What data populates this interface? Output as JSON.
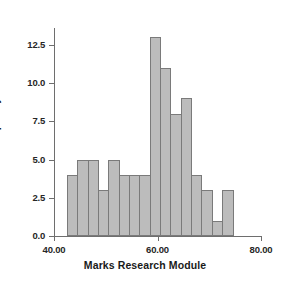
{
  "chart_data": {
    "type": "bar",
    "title": "",
    "xlabel": "Marks Research Module",
    "ylabel": "Frequency",
    "xlim": [
      40.0,
      80.0
    ],
    "ylim": [
      0.0,
      13.5
    ],
    "grid": false,
    "legend": null,
    "bin_width": 2.0,
    "bin_edges": [
      42.5,
      44.5,
      46.5,
      48.5,
      50.5,
      52.5,
      54.5,
      56.5,
      58.5,
      60.5,
      62.5,
      64.5,
      66.5,
      68.5,
      70.5,
      72.5,
      74.5
    ],
    "categories": [
      "42.5",
      "44.5",
      "46.5",
      "48.5",
      "50.5",
      "52.5",
      "54.5",
      "56.5",
      "58.5",
      "60.5",
      "62.5",
      "64.5",
      "66.5",
      "68.5",
      "70.5",
      "72.5"
    ],
    "values": [
      4,
      5,
      5,
      3,
      5,
      4,
      4,
      4,
      13,
      11,
      8,
      9,
      4,
      3,
      1,
      3
    ],
    "xticks": [
      40.0,
      60.0,
      80.0
    ],
    "xtick_labels": [
      "40.00",
      "60.00",
      "80.00"
    ],
    "yticks": [
      0.0,
      2.5,
      5.0,
      7.5,
      10.0,
      12.5
    ],
    "ytick_labels": [
      "0.0",
      "2.5",
      "5.0",
      "7.5",
      "10.0",
      "12.5"
    ],
    "bar_fill_color": "#bcbcbc",
    "bar_border_color": "#7a7a7a",
    "axis_color": "#6e6e6e",
    "background_color": "#ffffff"
  }
}
